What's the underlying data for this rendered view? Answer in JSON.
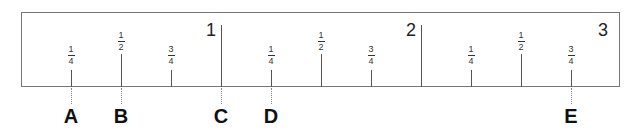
{
  "diagram": {
    "type": "ruler",
    "units": "inches",
    "inch_labels": [
      {
        "label": "1",
        "x": 221
      },
      {
        "label": "2",
        "x": 421
      },
      {
        "label": "3",
        "x": 620
      }
    ],
    "fraction_marks": [
      {
        "num": "1",
        "den": "4",
        "x": 71,
        "kind": "quarter"
      },
      {
        "num": "1",
        "den": "2",
        "x": 121,
        "kind": "half"
      },
      {
        "num": "3",
        "den": "4",
        "x": 171,
        "kind": "quarter"
      },
      {
        "num": "1",
        "den": "4",
        "x": 271,
        "kind": "quarter"
      },
      {
        "num": "1",
        "den": "2",
        "x": 321,
        "kind": "half"
      },
      {
        "num": "3",
        "den": "4",
        "x": 371,
        "kind": "quarter"
      },
      {
        "num": "1",
        "den": "4",
        "x": 471,
        "kind": "quarter"
      },
      {
        "num": "1",
        "den": "2",
        "x": 521,
        "kind": "half"
      },
      {
        "num": "3",
        "den": "4",
        "x": 571,
        "kind": "quarter"
      }
    ],
    "point_labels": [
      {
        "label": "A",
        "x": 71,
        "value": "1/4"
      },
      {
        "label": "B",
        "x": 121,
        "value": "1/2"
      },
      {
        "label": "C",
        "x": 221,
        "value": "1"
      },
      {
        "label": "D",
        "x": 271,
        "value": "1 1/4"
      },
      {
        "label": "E",
        "x": 571,
        "value": "2 3/4"
      }
    ]
  }
}
